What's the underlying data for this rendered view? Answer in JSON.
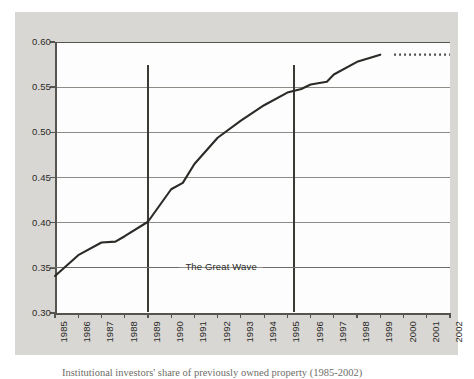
{
  "figure": {
    "caption": "Institutional investors' share of previously owned property (1985-2002)",
    "annotation": {
      "label": "The Great Wave",
      "start_year": 1989,
      "end_year": 1995.3,
      "value_level": 0.351
    },
    "colors": {
      "panel_background": "#d9d7d3",
      "plot_background": "#fdfdfd",
      "axis": "#55544f",
      "gridline": "#8d8c87",
      "series_line": "#2b2a27",
      "marker_line": "#3b3a37",
      "text": "#2b2a27"
    }
  },
  "chart_data": {
    "type": "line",
    "title": "",
    "subtitle": "",
    "xlabel": "",
    "ylabel": "",
    "xlim": [
      1985,
      2002
    ],
    "ylim": [
      0.3,
      0.6
    ],
    "grid": true,
    "legend": "none",
    "x_ticks": [
      "1985",
      "1986",
      "1987",
      "1988",
      "1989",
      "1990",
      "1991",
      "1992",
      "1993",
      "1994",
      "1995",
      "1996",
      "1997",
      "1998",
      "1999",
      "2000",
      "2001",
      "2002"
    ],
    "y_ticks": [
      "0.30",
      "0.35",
      "0.40",
      "0.45",
      "0.50",
      "0.55",
      "0.60"
    ],
    "y_tick_values": [
      0.3,
      0.35,
      0.4,
      0.45,
      0.5,
      0.55,
      0.6
    ],
    "series": [
      {
        "name": "observed",
        "style": "solid",
        "x": [
          1985,
          1986,
          1987,
          1987.6,
          1988,
          1989,
          1990,
          1990.5,
          1991,
          1992,
          1993,
          1994,
          1995,
          1995.6,
          1996,
          1996.7,
          1997,
          1998,
          1999
        ],
        "values": [
          0.341,
          0.364,
          0.378,
          0.379,
          0.385,
          0.401,
          0.437,
          0.444,
          0.465,
          0.494,
          0.513,
          0.53,
          0.544,
          0.548,
          0.553,
          0.556,
          0.564,
          0.578,
          0.586
        ]
      },
      {
        "name": "projected",
        "style": "dotted",
        "x": [
          1999.6,
          2000,
          2001,
          2002
        ],
        "values": [
          0.586,
          0.586,
          0.586,
          0.586
        ]
      }
    ],
    "markers": [
      {
        "name": "wave-start",
        "x": 1989,
        "y_top": 0.575,
        "y_bottom": 0.301
      },
      {
        "name": "wave-end",
        "x": 1995.3,
        "y_top": 0.574,
        "y_bottom": 0.301
      }
    ]
  }
}
